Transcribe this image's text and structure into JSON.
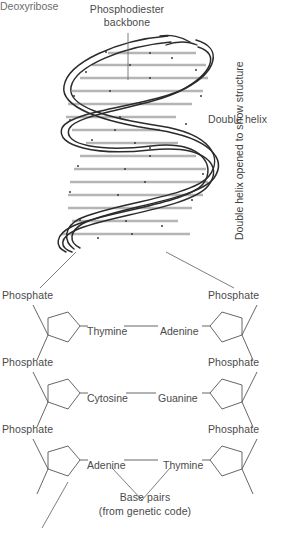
{
  "diagram": {
    "title_top": "Phosphodiester\nbackbone",
    "labels": {
      "phosphodiester_line1": "Phosphodiester",
      "phosphodiester_line2": "backbone",
      "double_helix": "Double helix",
      "double_helix_opened": "Double helix opened to show structure",
      "base_pairs_line1": "Base pairs",
      "base_pairs_line2": "(from genetic code)",
      "deoxyribose": "Deoxyribose"
    },
    "phosphate_label": "Phosphate",
    "nucleotide_rows": [
      {
        "left_phosphate": "Phosphate",
        "right_phosphate": "Phosphate",
        "left_base": "Thymine",
        "right_base": "Adenine"
      },
      {
        "left_phosphate": "Phosphate",
        "right_phosphate": "Phosphate",
        "left_base": "Cytosine",
        "right_base": "Guanine"
      },
      {
        "left_phosphate": "Phosphate",
        "right_phosphate": "Phosphate",
        "left_base": "Adenine",
        "right_base": "Thymine"
      }
    ],
    "colors": {
      "stroke": "#2b2b2b",
      "text": "#4a4a4a",
      "rung": "#b8b8b8",
      "leader": "#6f6f6f"
    }
  }
}
